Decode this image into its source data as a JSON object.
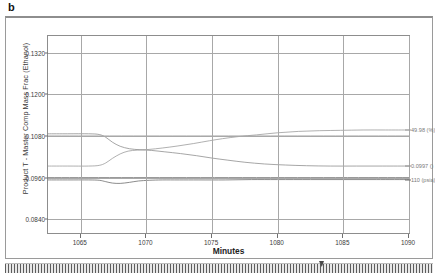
{
  "panel": {
    "letter": "b"
  },
  "chart_data": {
    "type": "line",
    "title": "",
    "xlabel": "Minutes",
    "ylabel": "Product T - Master Comp Mass Frac (Ethanol)",
    "xlim": [
      1062.5,
      1090.0
    ],
    "ylim": [
      0.08,
      0.1368
    ],
    "grid": true,
    "legend_position": "right-inline",
    "xticks": [
      1065,
      1070,
      1075,
      1080,
      1085,
      1090
    ],
    "xtick_labels": [
      "1065",
      "1070",
      "1075",
      "1080",
      "1085",
      "1090"
    ],
    "yticks": [
      0.084,
      0.096,
      0.108,
      0.12,
      0.132
    ],
    "ytick_labels": [
      "0.0840",
      "0.0960",
      "0.1080",
      "0.1200",
      "0.1320"
    ],
    "series": [
      {
        "name": "49.98 (%)",
        "annotation": "49.98 (%)",
        "color": "#9c9c9c",
        "x": [
          1062.5,
          1064.0,
          1065.6,
          1066.4,
          1066.9,
          1067.4,
          1068.0,
          1068.6,
          1069.3,
          1070.2,
          1071.2,
          1072.4,
          1073.6,
          1074.8,
          1075.8,
          1077.0,
          1078.4,
          1080.0,
          1081.6,
          1083.2,
          1084.8,
          1086.5,
          1088.2,
          1090.0
        ],
        "y": [
          0.0993,
          0.0993,
          0.0993,
          0.0995,
          0.1002,
          0.1015,
          0.1028,
          0.1036,
          0.1039,
          0.1041,
          0.1045,
          0.1051,
          0.1058,
          0.1066,
          0.1072,
          0.1078,
          0.1083,
          0.1089,
          0.1093,
          0.1095,
          0.1096,
          0.1097,
          0.1097,
          0.1097
        ]
      },
      {
        "name": "0.0997 ()",
        "annotation": "0.0997 ()",
        "color": "#8f8f8f",
        "x": [
          1062.5,
          1064.0,
          1065.6,
          1066.4,
          1066.9,
          1067.4,
          1068.0,
          1068.7,
          1069.5,
          1070.4,
          1071.4,
          1072.6,
          1073.8,
          1075.0,
          1076.2,
          1077.5,
          1079.0,
          1080.6,
          1082.2,
          1084.0,
          1086.0,
          1088.0,
          1090.0
        ],
        "y": [
          0.1086,
          0.1086,
          0.1086,
          0.1084,
          0.1076,
          0.1062,
          0.105,
          0.1043,
          0.104,
          0.1038,
          0.1034,
          0.1029,
          0.1023,
          0.1016,
          0.101,
          0.1004,
          0.0999,
          0.0996,
          0.0994,
          0.0993,
          0.0993,
          0.0993,
          0.0993
        ]
      },
      {
        "name": "110 (psia)",
        "annotation": "110 (psia)",
        "color": "#6e6e6e",
        "x": [
          1062.5,
          1064.0,
          1065.6,
          1066.4,
          1066.9,
          1067.4,
          1068.0,
          1068.7,
          1069.4,
          1070.2,
          1071.2,
          1072.5,
          1074.0,
          1076.0,
          1078.0,
          1080.0,
          1082.5,
          1085.0,
          1087.5,
          1090.0
        ],
        "y": [
          0.0953,
          0.0953,
          0.0953,
          0.0952,
          0.0948,
          0.0944,
          0.0943,
          0.0946,
          0.095,
          0.0952,
          0.0953,
          0.0953,
          0.0953,
          0.0953,
          0.0954,
          0.0954,
          0.0954,
          0.0954,
          0.0954,
          0.0954
        ]
      },
      {
        "name": "setpoint-upper",
        "annotation": "",
        "color": "#a0a0a0",
        "x": [
          1062.5,
          1090.0
        ],
        "y": [
          0.108,
          0.108
        ]
      },
      {
        "name": "setpoint-lower",
        "annotation": "",
        "color": "#808080",
        "x": [
          1062.5,
          1090.0
        ],
        "y": [
          0.096,
          0.096
        ]
      }
    ]
  },
  "scrollbar": {
    "name": "horizontal-scrollbar"
  }
}
